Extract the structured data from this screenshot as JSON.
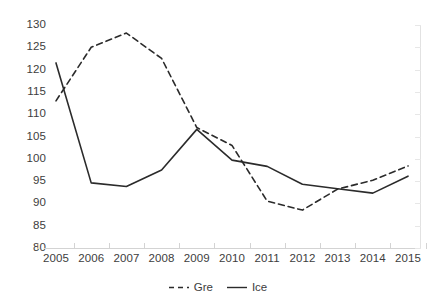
{
  "chart_data": {
    "type": "line",
    "title": "",
    "xlabel": "",
    "ylabel": "",
    "categories": [
      "2005",
      "2006",
      "2007",
      "2008",
      "2009",
      "2010",
      "2011",
      "2012",
      "2013",
      "2014",
      "2015"
    ],
    "ylim": [
      80,
      130
    ],
    "yticks": [
      130,
      125,
      120,
      115,
      110,
      105,
      100,
      95,
      90,
      85,
      80
    ],
    "grid": false,
    "legend_position": "bottom-center",
    "series": [
      {
        "name": "Gre",
        "style": "dashed",
        "color": "#2b2b2b",
        "values": [
          113.0,
          125.0,
          128.2,
          122.5,
          107.0,
          103.0,
          90.5,
          88.5,
          93.2,
          95.2,
          98.4
        ]
      },
      {
        "name": "Ice",
        "style": "solid",
        "color": "#2b2b2b",
        "values": [
          121.5,
          94.6,
          93.8,
          97.5,
          106.6,
          99.7,
          98.3,
          94.3,
          93.3,
          92.3,
          96.1
        ]
      }
    ]
  },
  "legend": {
    "entries": [
      {
        "label": "Gre",
        "icon": "dashed-line-swatch"
      },
      {
        "label": "Ice",
        "icon": "solid-line-swatch"
      }
    ]
  },
  "colors": {
    "axis": "#d3d3d3",
    "text": "#3d3d3d",
    "series": "#2b2b2b",
    "background": "#ffffff"
  }
}
